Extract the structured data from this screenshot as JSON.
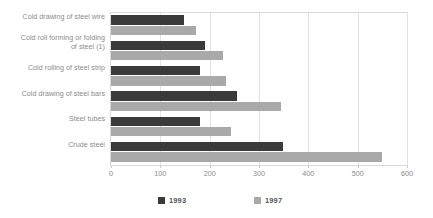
{
  "chart_data": {
    "type": "bar",
    "orientation": "horizontal",
    "title": "",
    "subtitle": "",
    "xlabel": "",
    "ylabel": "",
    "xlim": [
      0,
      600
    ],
    "xticks": [
      0,
      100,
      200,
      300,
      400,
      500,
      600
    ],
    "xtick_labels": [
      "0",
      "100",
      "200",
      "300",
      "400",
      "500",
      "600"
    ],
    "grid": true,
    "grid_axis": "x",
    "legend_position": "bottom",
    "categories": [
      "Cold drawing of steel wire",
      "Cold roll forming or folding of steel (1)",
      "Cold rolling of steel strip",
      "Cold drawing of steel bars",
      "Steel tubes",
      "Crude steel"
    ],
    "series": [
      {
        "name": "1993",
        "color": "#3a3a3a",
        "values": [
          148,
          190,
          181,
          256,
          181,
          349
        ]
      },
      {
        "name": "1997",
        "color": "#a9a9a9",
        "values": [
          172,
          227,
          234,
          345,
          243,
          549
        ]
      }
    ]
  },
  "labels": {
    "cat_0_line_0": "Cold drawing of steel wire",
    "cat_1_line_0": "Cold roll forming or folding",
    "cat_1_line_1": "of steel (1)",
    "cat_2_line_0": "Cold rolling of steel strip",
    "cat_3_line_0": "Cold drawing of steel bars",
    "cat_4_line_0": "Steel tubes",
    "cat_5_line_0": "Crude steel"
  },
  "axis": {
    "t0": "0",
    "t1": "100",
    "t2": "200",
    "t3": "300",
    "t4": "400",
    "t5": "500",
    "t6": "600"
  },
  "legend": {
    "item_0": "1993",
    "item_1": "1997"
  },
  "colors": {
    "series_1993": "#3a3a3a",
    "series_1997": "#a9a9a9",
    "gridline": "#e2e2e2",
    "plot_border": "#d9d9d9",
    "label_text": "#8a8a8a",
    "legend_text": "#555555",
    "background": "#ffffff"
  }
}
